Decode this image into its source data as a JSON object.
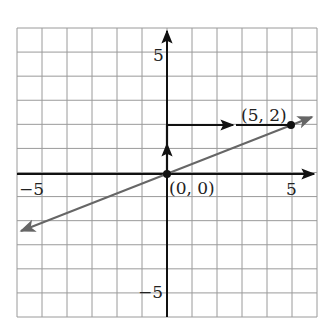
{
  "chart_data": {
    "type": "line",
    "title": "",
    "xlabel": "",
    "ylabel": "",
    "xlim": [
      -6,
      6
    ],
    "ylim": [
      -6,
      6
    ],
    "grid": true,
    "grid_step": 1,
    "x_ticks_labeled": [
      -5,
      5
    ],
    "y_ticks_labeled": [
      5,
      -5
    ],
    "tick_labels": {
      "x_neg": "−5",
      "x_pos": "5",
      "y_pos": "5",
      "y_neg": "−5"
    },
    "series": [
      {
        "name": "line y = (2/5)x",
        "style": "gray, arrows both ends",
        "x": [
          -5.9,
          5.9
        ],
        "y": [
          -2.36,
          2.36
        ]
      }
    ],
    "points": [
      {
        "x": 0,
        "y": 0,
        "label": "(0, 0)"
      },
      {
        "x": 5,
        "y": 2,
        "label": "(5, 2)"
      }
    ],
    "annotations": [
      {
        "type": "arrow",
        "from": [
          0,
          0
        ],
        "to": [
          0,
          2
        ],
        "label": "rise 2"
      },
      {
        "type": "arrow",
        "from": [
          0,
          2
        ],
        "to": [
          5,
          2
        ],
        "label": "run 5"
      }
    ],
    "colors": {
      "grid": "#9a9a9a",
      "axes": "#111111",
      "line": "#666666",
      "points": "#111111"
    }
  }
}
